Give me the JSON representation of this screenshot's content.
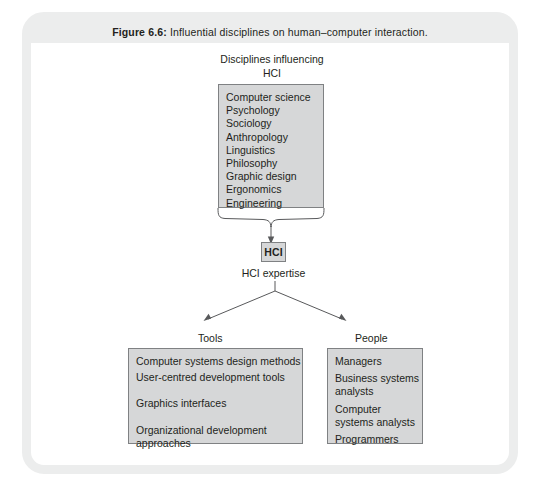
{
  "caption": {
    "figure_label": "Figure 6.6:",
    "text": " Influential disciplines on human–computer interaction."
  },
  "diagram": {
    "top_title_line1": "Disciplines influencing",
    "top_title_line2": "HCI",
    "disciplines": [
      "Computer science",
      "Psychology",
      "Sociology",
      "Anthropology",
      "Linguistics",
      "Philosophy",
      "Graphic design",
      "Ergonomics",
      "Engineering"
    ],
    "hci_node_label": "HCI",
    "hci_expertise_label": "HCI expertise",
    "branches": [
      {
        "label": "Tools",
        "items": [
          "Computer systems design methods",
          "User-centred development tools",
          "Graphics interfaces",
          "Organizational development approaches"
        ]
      },
      {
        "label": "People",
        "items": [
          "Managers",
          "Business systems analysts",
          "Computer systems analysts",
          "Programmers"
        ]
      }
    ]
  },
  "colors": {
    "frame": "#eceded",
    "box_fill": "#d6d7d8",
    "box_border": "#7f8183",
    "text": "#231f20",
    "connector": "#58595b"
  }
}
